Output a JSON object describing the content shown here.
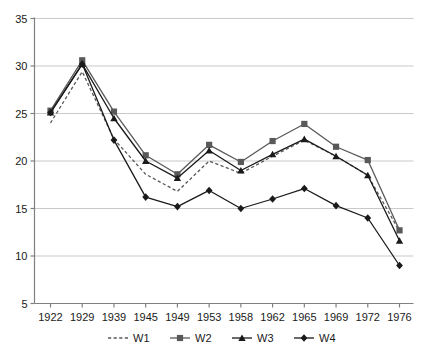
{
  "chart_data": {
    "type": "line",
    "title": "",
    "subtitle": "",
    "xlabel": "",
    "ylabel": "",
    "categories": [
      "1922",
      "1929",
      "1939",
      "1945",
      "1949",
      "1953",
      "1958",
      "1962",
      "1965",
      "1969",
      "1972",
      "1976"
    ],
    "ylim": [
      5,
      35
    ],
    "yticks": [
      5,
      10,
      15,
      20,
      25,
      30,
      35
    ],
    "ytick_labels": [
      "5",
      "10",
      "15",
      "20",
      "25",
      "30",
      "35"
    ],
    "grid": true,
    "grid_axis": "y",
    "legend_position": "bottom",
    "series": [
      {
        "name": "W1",
        "marker": "none",
        "line_style": "dashed",
        "color": "#595959",
        "values": [
          24.0,
          29.4,
          22.3,
          18.6,
          16.8,
          20.0,
          18.7,
          20.5,
          22.2,
          20.5,
          18.5,
          12.6
        ]
      },
      {
        "name": "W2",
        "marker": "square",
        "line_style": "solid",
        "color": "#595959",
        "values": [
          25.3,
          30.6,
          25.2,
          20.6,
          18.6,
          21.7,
          19.9,
          22.1,
          23.9,
          21.5,
          20.1,
          12.7
        ]
      },
      {
        "name": "W3",
        "marker": "triangle",
        "line_style": "solid",
        "color": "#1a1a1a",
        "values": [
          25.1,
          30.2,
          24.5,
          20.0,
          18.2,
          21.1,
          19.0,
          20.7,
          22.3,
          20.5,
          18.5,
          11.6
        ]
      },
      {
        "name": "W4",
        "marker": "diamond",
        "line_style": "solid",
        "color": "#1a1a1a",
        "values": [
          25.1,
          30.2,
          22.2,
          16.2,
          15.2,
          16.9,
          15.0,
          16.0,
          17.1,
          15.3,
          14.0,
          9.0
        ]
      }
    ]
  },
  "legend": {
    "items": [
      {
        "label": "W1"
      },
      {
        "label": "W2"
      },
      {
        "label": "W3"
      },
      {
        "label": "W4"
      }
    ]
  },
  "colors": {
    "grid": "#c9c9c9",
    "axis": "#808080",
    "series_gray": "#595959",
    "series_dark": "#1a1a1a",
    "background": "#ffffff"
  }
}
